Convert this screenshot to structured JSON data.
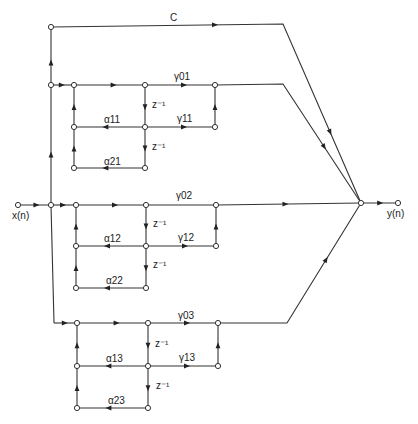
{
  "diagram": {
    "type": "signal-flow-graph",
    "input_label": "x(n)",
    "output_label": "y(n)",
    "direct_gain_label": "C",
    "sections": [
      {
        "id": 1,
        "gamma0": "γ01",
        "gamma1": "γ11",
        "alpha1": "α11",
        "alpha2": "α21",
        "delay1": "z⁻¹",
        "delay2": "z⁻¹"
      },
      {
        "id": 2,
        "gamma0": "γ02",
        "gamma1": "γ12",
        "alpha1": "α12",
        "alpha2": "α22",
        "delay1": "z⁻¹",
        "delay2": "z⁻¹"
      },
      {
        "id": 3,
        "gamma0": "γ03",
        "gamma1": "γ13",
        "alpha1": "α13",
        "alpha2": "α23",
        "delay1": "z⁻¹",
        "delay2": "z⁻¹"
      }
    ]
  }
}
